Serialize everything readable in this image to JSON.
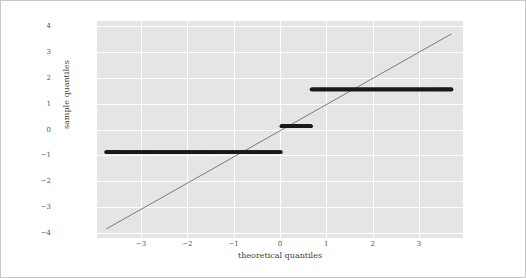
{
  "chart_data": {
    "type": "scatter",
    "title": "",
    "xlabel": "theoretical quantiles",
    "ylabel": "sample quantiles",
    "xlim": [
      -3.95,
      3.95
    ],
    "ylim": [
      -4.2,
      4.2
    ],
    "xticks": [
      -3,
      -2,
      -1,
      0,
      1,
      2,
      3
    ],
    "xticklabels": [
      "−3",
      "−2",
      "−1",
      "0",
      "1",
      "2",
      "3"
    ],
    "yticks": [
      -4,
      -3,
      -2,
      -1,
      0,
      1,
      2,
      3,
      4
    ],
    "yticklabels": [
      "−4",
      "−3",
      "−2",
      "−1",
      "0",
      "1",
      "2",
      "3",
      "4"
    ],
    "grid": true,
    "grid_color": "#ffffff",
    "axes_facecolor": "#e5e5e5",
    "figure_facecolor": "#ffffff",
    "legend": null,
    "marker_color": "#1a1a1a",
    "marker_size": 2.6,
    "reference_line": {
      "name": "45-degree reference line",
      "color": "#6e6e6e",
      "width": 0.9,
      "x": [
        -3.75,
        3.7
      ],
      "y": [
        -3.85,
        3.7
      ]
    },
    "series": [
      {
        "name": "band-low",
        "y_value": -0.87,
        "x_start": -3.75,
        "x_end": 0.02,
        "n_points": 260,
        "isolated_x": [
          -3.75,
          -3.61,
          -3.5
        ]
      },
      {
        "name": "band-mid",
        "y_value": 0.13,
        "x_start": 0.03,
        "x_end": 0.67,
        "n_points": 60,
        "isolated_x": []
      },
      {
        "name": "band-high",
        "y_value": 1.55,
        "x_start": 0.68,
        "x_end": 3.7,
        "n_points": 230,
        "isolated_x": [
          3.45,
          3.56,
          3.7
        ]
      }
    ]
  }
}
